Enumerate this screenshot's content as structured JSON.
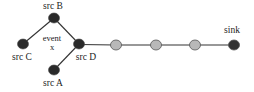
{
  "diagram": {
    "type": "network-topology",
    "colors": {
      "source_node": "#2a2a2a",
      "relay_node": "#b8b8b8",
      "sink_node": "#333333",
      "edge": "#333333",
      "node_stroke": "#555555"
    },
    "nodes": [
      {
        "id": "srcB",
        "label": "src B",
        "kind": "source",
        "x": 54,
        "y": 18
      },
      {
        "id": "srcC",
        "label": "src C",
        "kind": "source",
        "x": 23,
        "y": 44
      },
      {
        "id": "srcD",
        "label": "src D",
        "kind": "source",
        "x": 79,
        "y": 44
      },
      {
        "id": "srcA",
        "label": "src A",
        "kind": "source",
        "x": 54,
        "y": 70
      },
      {
        "id": "r1",
        "label": "",
        "kind": "relay",
        "x": 116,
        "y": 45
      },
      {
        "id": "r2",
        "label": "",
        "kind": "relay",
        "x": 156,
        "y": 45
      },
      {
        "id": "r3",
        "label": "",
        "kind": "relay",
        "x": 195,
        "y": 45
      },
      {
        "id": "sink",
        "label": "sink",
        "kind": "sink",
        "x": 234,
        "y": 45
      }
    ],
    "edges": [
      {
        "from": "srcB",
        "to": "srcC"
      },
      {
        "from": "srcB",
        "to": "srcD"
      },
      {
        "from": "srcA",
        "to": "srcD"
      },
      {
        "from": "srcD",
        "to": "r1"
      },
      {
        "from": "r1",
        "to": "r2"
      },
      {
        "from": "r2",
        "to": "r3"
      },
      {
        "from": "r3",
        "to": "sink"
      }
    ],
    "annotation": {
      "line1": "event",
      "line2": "x"
    },
    "labels": {
      "srcB": "src B",
      "srcC": "src C",
      "srcD": "src D",
      "srcA": "src A",
      "sink": "sink"
    }
  }
}
